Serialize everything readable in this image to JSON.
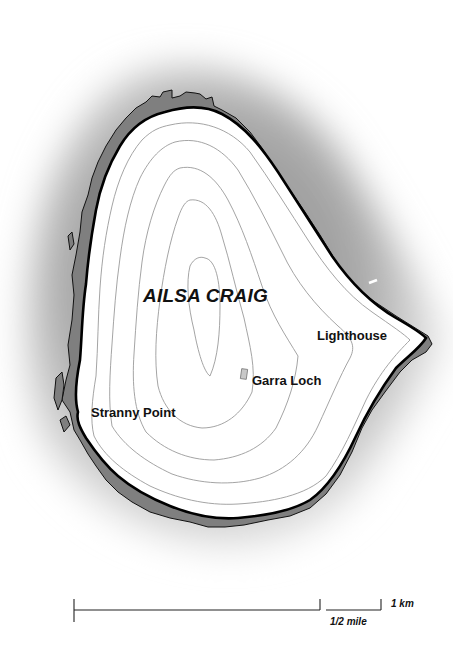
{
  "map": {
    "title": "AILSA CRAIG",
    "places": [
      {
        "id": "lighthouse",
        "label": "Lighthouse"
      },
      {
        "id": "garra-loch",
        "label": "Garra Loch"
      },
      {
        "id": "stranny-point",
        "label": "Stranny Point"
      }
    ],
    "scale": {
      "km_label": "1 km",
      "mile_label": "1/2 mile"
    },
    "colors": {
      "land": "#ffffff",
      "foreshore": "#7f7f7f",
      "sea_dark": "#9a9a9a",
      "sea_light": "#ffffff",
      "coastline": "#000000",
      "contour": "#9a9a9a"
    }
  }
}
